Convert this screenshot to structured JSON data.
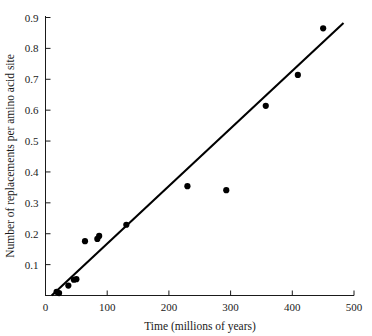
{
  "chart_data": {
    "type": "scatter",
    "title": "",
    "xlabel": "Time (millions of years)",
    "ylabel": "Number of replacements per amino acid site",
    "xlim": [
      0,
      500
    ],
    "ylim": [
      0,
      0.9
    ],
    "grid": false,
    "legend": null,
    "xticks": [
      0,
      100,
      200,
      300,
      400,
      500
    ],
    "xtick_labels": [
      "0",
      "100",
      "200",
      "300",
      "400",
      "500"
    ],
    "yticks": [
      0.1,
      0.2,
      0.3,
      0.4,
      0.5,
      0.6,
      0.7,
      0.8,
      0.9
    ],
    "ytick_labels": [
      "0.1",
      "0.2",
      "0.3",
      "0.4",
      "0.5",
      "0.6",
      "0.7",
      "0.8",
      "0.9"
    ],
    "series": [
      {
        "name": "Amino acid replacements",
        "marker": "filled-circle",
        "color": "#000000",
        "points": [
          {
            "x": 18,
            "y": 0.012
          },
          {
            "x": 22,
            "y": 0.008
          },
          {
            "x": 37,
            "y": 0.032
          },
          {
            "x": 46,
            "y": 0.051
          },
          {
            "x": 50,
            "y": 0.053
          },
          {
            "x": 64,
            "y": 0.176
          },
          {
            "x": 84,
            "y": 0.183
          },
          {
            "x": 87,
            "y": 0.193
          },
          {
            "x": 131,
            "y": 0.229
          },
          {
            "x": 230,
            "y": 0.354
          },
          {
            "x": 293,
            "y": 0.341
          },
          {
            "x": 357,
            "y": 0.614
          },
          {
            "x": 409,
            "y": 0.714
          },
          {
            "x": 450,
            "y": 0.865
          }
        ]
      }
    ],
    "fit_line": {
      "name": "linear regression",
      "color": "#000000",
      "x_start": 10,
      "y_start": 0.0,
      "x_end": 483,
      "y_end": 0.882
    }
  }
}
